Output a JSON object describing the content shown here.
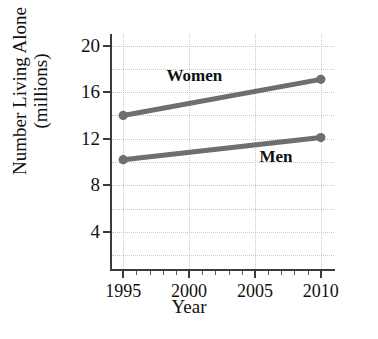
{
  "figure": {
    "title_cropped": "g",
    "x_axis_title": "Year",
    "y_axis_title_line1": "Number Living Alone",
    "y_axis_title_line2": "(millions)"
  },
  "colors": {
    "line": "#6e6e6e",
    "axis": "#3b3b3b",
    "grid": "#c9c9c9",
    "text": "#111111",
    "background": "#ffffff"
  },
  "axes": {
    "y_ticks": [
      "4",
      "8",
      "12",
      "16",
      "20"
    ],
    "x_ticks": [
      "1995",
      "2000",
      "2005",
      "2010"
    ]
  },
  "annotations": [
    {
      "label": "Women",
      "x": 2000.4,
      "y": 17.4
    },
    {
      "label": "Men",
      "x": 2006.6,
      "y": 10.4
    }
  ],
  "chart_data": {
    "type": "line",
    "title": "",
    "xlabel": "Year",
    "ylabel": "Number Living Alone (millions)",
    "xlim": [
      1994,
      2011
    ],
    "ylim": [
      0.8,
      21.0
    ],
    "grid": true,
    "legend": "inline-labels",
    "x": [
      1995,
      2010
    ],
    "series": [
      {
        "name": "Women",
        "values": [
          14.0,
          17.1
        ],
        "color": "#6e6e6e"
      },
      {
        "name": "Men",
        "values": [
          10.2,
          12.1
        ],
        "color": "#6e6e6e"
      }
    ],
    "x_tick_values": [
      1995,
      2000,
      2005,
      2010
    ],
    "y_tick_values": [
      4,
      8,
      12,
      16,
      20
    ],
    "x_minor_tick_step": 1
  }
}
